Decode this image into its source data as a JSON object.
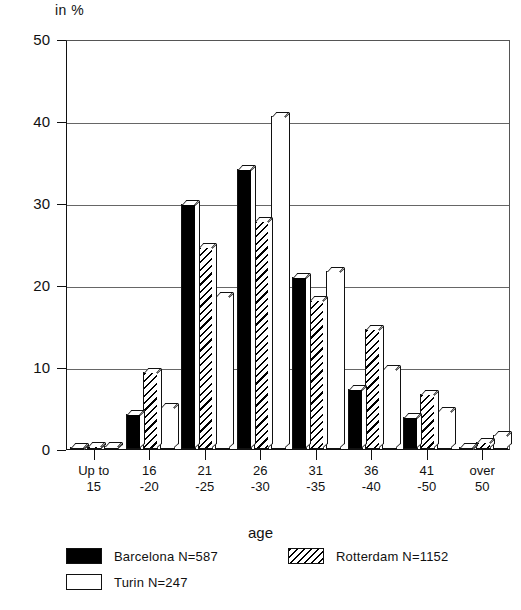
{
  "chart_data": {
    "type": "bar",
    "title": "",
    "unit_label": "in %",
    "xlabel": "age",
    "ylabel": "in %",
    "ylim": [
      0,
      50
    ],
    "yticks": [
      0,
      10,
      20,
      30,
      40,
      50
    ],
    "grid": true,
    "legend_position": "bottom",
    "categories": [
      "Up to 15",
      "16 -20",
      "21 -25",
      "26 -30",
      "31 -35",
      "36 -40",
      "41 -50",
      "over 50"
    ],
    "category_lines": [
      [
        "Up to",
        "15"
      ],
      [
        "16",
        "-20"
      ],
      [
        "21",
        "-25"
      ],
      [
        "26",
        "-30"
      ],
      [
        "31",
        "-35"
      ],
      [
        "36",
        "-40"
      ],
      [
        "41",
        "-50"
      ],
      [
        "over",
        "50"
      ]
    ],
    "series": [
      {
        "name": "Barcelona N=587",
        "key": "barcelona",
        "fill": "solid-black",
        "values": [
          0.3,
          4.3,
          29.9,
          34.1,
          21.0,
          7.3,
          3.9,
          0.2
        ]
      },
      {
        "name": "Rotterdam N=1152",
        "key": "rotterdam",
        "fill": "diagonal-hatch",
        "values": [
          0.4,
          9.4,
          24.6,
          27.8,
          18.2,
          14.6,
          6.7,
          0.9
        ]
      },
      {
        "name": "Turin N=247",
        "key": "turin",
        "fill": "white",
        "values": [
          0.4,
          5.1,
          18.7,
          40.6,
          21.7,
          9.8,
          4.6,
          1.7
        ]
      }
    ]
  },
  "legend": {
    "items": [
      {
        "label": "Barcelona N=587",
        "key": "barcelona"
      },
      {
        "label": "Rotterdam N=1152",
        "key": "rotterdam"
      },
      {
        "label": "Turin N=247",
        "key": "turin"
      }
    ]
  },
  "axes": {
    "y_unit": "in %",
    "x_title": "age",
    "y_tick_labels": [
      "0",
      "10",
      "20",
      "30",
      "40",
      "50"
    ]
  }
}
